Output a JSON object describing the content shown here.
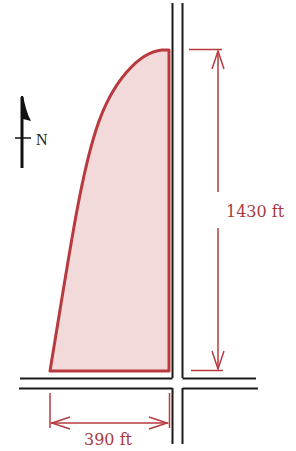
{
  "diagram": {
    "type": "site plan",
    "compass": {
      "label": "N",
      "icon": "north-arrow-icon"
    },
    "lot": {
      "shape": "curved parcel bounded by two roads",
      "fill_color": "#f2dada",
      "stroke_color": "#b83a3f"
    },
    "roads": {
      "color": "#1a1a1a",
      "count": 2,
      "orientation": [
        "north-south",
        "east-west"
      ]
    },
    "dimensions": {
      "height": {
        "label": "1430 ft",
        "value": 1430,
        "unit": "ft",
        "orientation": "vertical"
      },
      "width": {
        "label": "390 ft",
        "value": 390,
        "unit": "ft",
        "orientation": "horizontal"
      }
    },
    "dimension_color": "#b83a3f"
  }
}
